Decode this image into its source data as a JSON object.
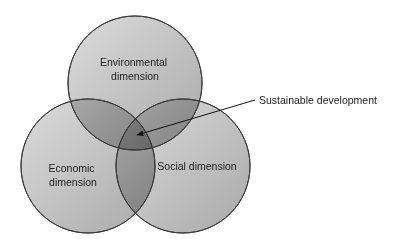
{
  "diagram": {
    "type": "venn",
    "circles": [
      {
        "id": "environmental",
        "label_lines": [
          "Environmental",
          "dimension"
        ],
        "cx": 135,
        "cy": 83,
        "r": 67
      },
      {
        "id": "economic",
        "label_lines": [
          "Economic",
          "dimension"
        ],
        "cx": 88,
        "cy": 166,
        "r": 67
      },
      {
        "id": "social",
        "label_lines": [
          "Social dimension"
        ],
        "cx": 183,
        "cy": 166,
        "r": 67
      }
    ],
    "callout": {
      "label": "Sustainable development",
      "points_to": "center intersection"
    }
  },
  "colors": {
    "circle_light": "#d8d8d8",
    "circle_dark": "#8c8c8c",
    "stroke": "#3a3a3a",
    "text": "#222222"
  }
}
